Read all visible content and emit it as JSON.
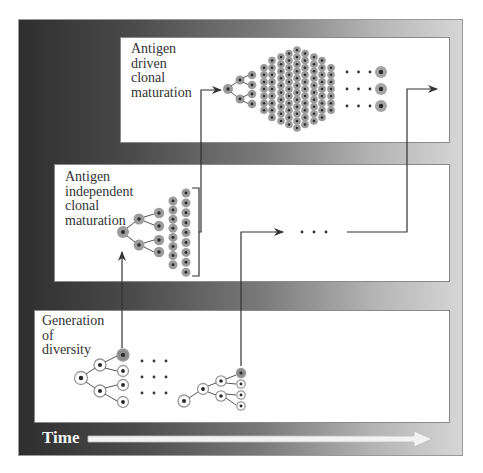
{
  "figure": {
    "panels": [
      {
        "id": "top",
        "label": "Antigen\ndriven\nclonal\nmaturation"
      },
      {
        "id": "middle",
        "label": "Antigen\nindependent\nclonal\nmaturation"
      },
      {
        "id": "bottom",
        "label": "Generation\nof\ndiversity"
      }
    ],
    "time_axis": {
      "label": "Time"
    },
    "ellipsis": "· · ·",
    "colors": {
      "frame_dark": "#2e2e2e",
      "frame_light": "#d6d6d6",
      "cell_filled": "#9a9a9a",
      "cell_outline": "#b0b0b0",
      "nucleus": "#2a2a2a",
      "connector": "#333333"
    }
  }
}
